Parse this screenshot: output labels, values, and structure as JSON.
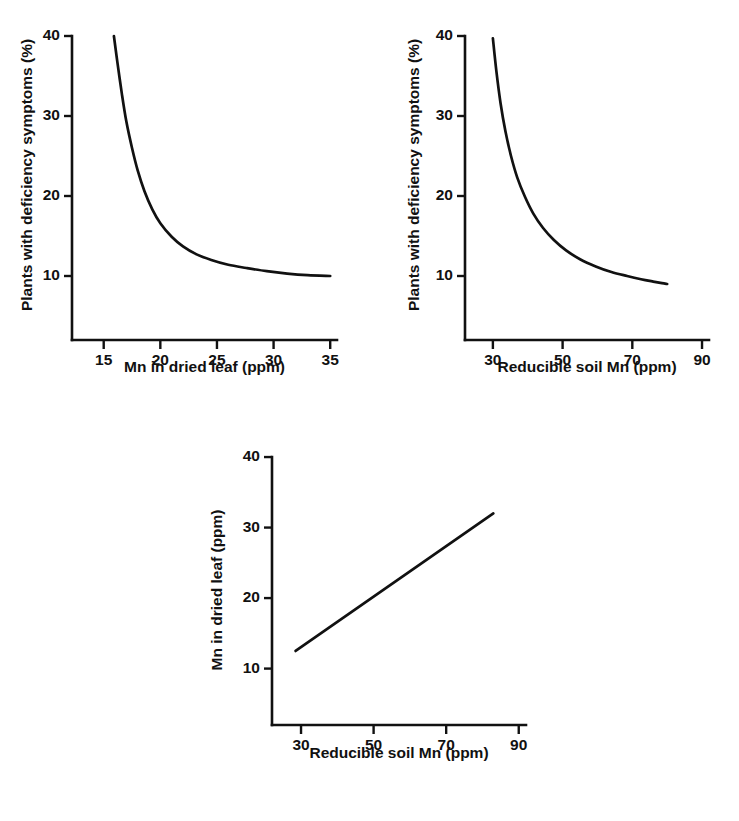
{
  "figure": {
    "background_color": "#ffffff",
    "ink_color": "#111111",
    "panel_count": 3
  },
  "chart_data": [
    {
      "id": "panel-top-left",
      "type": "line",
      "title": "",
      "xlabel": "Mn in dried leaf (ppm)",
      "ylabel": "Plants with deficiency symptoms (%)",
      "xlim": [
        12.2,
        35.6
      ],
      "ylim": [
        2.0,
        41.0
      ],
      "xticks": [
        15,
        20,
        25,
        30,
        35
      ],
      "xtick_labels": [
        "15",
        "20",
        "25",
        "30",
        "35"
      ],
      "yticks": [
        10,
        20,
        30,
        40
      ],
      "ytick_labels": [
        "10",
        "20",
        "30",
        "40"
      ],
      "grid": false,
      "legend": "none",
      "series": [
        {
          "name": "deficiency vs leaf Mn",
          "x": [
            15.9,
            16.2,
            16.6,
            17.0,
            17.5,
            18.0,
            18.6,
            19.3,
            20.0,
            21.0,
            22.0,
            23.2,
            24.5,
            26.0,
            27.6,
            29.4,
            31.2,
            33.0,
            35.0
          ],
          "y": [
            40.0,
            36.8,
            32.8,
            29.3,
            26.0,
            23.2,
            20.6,
            18.3,
            16.6,
            14.9,
            13.7,
            12.7,
            12.0,
            11.4,
            11.0,
            10.6,
            10.3,
            10.1,
            10.0
          ]
        }
      ]
    },
    {
      "id": "panel-top-right",
      "type": "line",
      "title": "",
      "xlabel": "Reducible soil Mn (ppm)",
      "ylabel": "Plants with deficiency symptoms (%)",
      "xlim": [
        22.0,
        92.0
      ],
      "ylim": [
        2.0,
        41.0
      ],
      "xticks": [
        30,
        50,
        70,
        90
      ],
      "xtick_labels": [
        "30",
        "50",
        "70",
        "90"
      ],
      "yticks": [
        10,
        20,
        30,
        40
      ],
      "ytick_labels": [
        "10",
        "20",
        "30",
        "40"
      ],
      "grid": false,
      "legend": "none",
      "series": [
        {
          "name": "deficiency vs soil Mn",
          "x": [
            30.0,
            31.0,
            32.2,
            33.6,
            35.2,
            37.0,
            39.2,
            41.6,
            44.4,
            47.5,
            51.0,
            55.0,
            59.5,
            64.0,
            68.5,
            72.5,
            76.0,
            78.5,
            80.0
          ],
          "y": [
            39.7,
            35.6,
            31.6,
            28.1,
            25.0,
            22.3,
            19.9,
            17.8,
            16.0,
            14.5,
            13.2,
            12.1,
            11.2,
            10.5,
            10.0,
            9.6,
            9.3,
            9.1,
            9.0
          ]
        }
      ]
    },
    {
      "id": "panel-bottom",
      "type": "line",
      "title": "",
      "xlabel": "Reducible soil Mn (ppm)",
      "ylabel": "Mn in dried leaf (ppm)",
      "xlim": [
        22.0,
        92.0
      ],
      "ylim": [
        2.0,
        41.0
      ],
      "xticks": [
        30,
        50,
        70,
        90
      ],
      "xtick_labels": [
        "30",
        "50",
        "70",
        "90"
      ],
      "yticks": [
        10,
        20,
        30,
        40
      ],
      "ytick_labels": [
        "10",
        "20",
        "30",
        "40"
      ],
      "grid": false,
      "legend": "none",
      "series": [
        {
          "name": "leaf Mn vs soil Mn",
          "x": [
            28.5,
            83.0
          ],
          "y": [
            12.5,
            32.0
          ]
        }
      ]
    }
  ]
}
